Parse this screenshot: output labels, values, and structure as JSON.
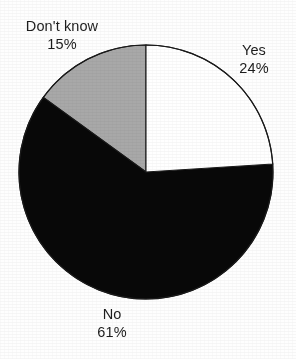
{
  "chart_data": {
    "type": "pie",
    "title": "",
    "subtitle": "",
    "xlabel": "",
    "ylabel": "",
    "legend_position": "none",
    "grid": false,
    "labels_placement": "outside-callout",
    "start_angle_deg": 0,
    "direction": "clockwise",
    "categories": [
      "Yes",
      "No",
      "Don't know"
    ],
    "values": [
      24,
      61,
      15
    ],
    "unit": "%",
    "slices": [
      {
        "label": "Yes",
        "value": 24,
        "value_text": "24%",
        "color": "#ffffff",
        "start_angle_deg": 0,
        "end_angle_deg": 86.4
      },
      {
        "label": "No",
        "value": 61,
        "value_text": "61%",
        "color": "#080808",
        "start_angle_deg": 86.4,
        "end_angle_deg": 306.0
      },
      {
        "label": "Don't know",
        "value": 15,
        "value_text": "15%",
        "color": "#a8a8a8",
        "start_angle_deg": 306.0,
        "end_angle_deg": 360.0
      }
    ]
  },
  "labels": {
    "dont_know": {
      "name": "Don't know",
      "value": "15%"
    },
    "yes": {
      "name": "Yes",
      "value": "24%"
    },
    "no": {
      "name": "No",
      "value": "61%"
    }
  },
  "colors": {
    "background": "#ffffff",
    "outline": "#1a1a1a",
    "slice_yes": "#ffffff",
    "slice_no": "#080808",
    "slice_dont_know": "#a8a8a8",
    "text": "#1c1c1c"
  },
  "geometry": {
    "center_x": 146,
    "center_y": 172,
    "radius": 127
  }
}
